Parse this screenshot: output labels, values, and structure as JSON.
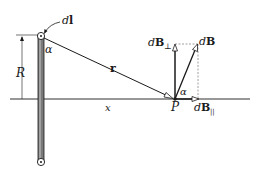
{
  "labels": {
    "dl_d": "d",
    "dl_l": "l",
    "alpha_wire": "α",
    "R": "R",
    "r": "r",
    "x": "x",
    "P": "P",
    "alpha_P": "α",
    "dB_perp_d": "d",
    "dB_perp_B": "B",
    "dB_perp_sub": "⊥",
    "dB_d": "d",
    "dB_B": "B",
    "dB_par_d": "d",
    "dB_par_B": "B",
    "dB_par_sub": "||"
  },
  "colors": {
    "ink": "#1a1a1a",
    "wire_fill": "#8a8a8a",
    "dashed": "#777777"
  }
}
